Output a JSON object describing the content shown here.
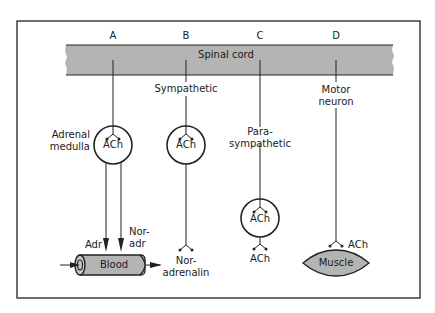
{
  "diagram": {
    "columns": [
      {
        "id": "A",
        "label": "A"
      },
      {
        "id": "B",
        "label": "B"
      },
      {
        "id": "C",
        "label": "C"
      },
      {
        "id": "D",
        "label": "D"
      }
    ],
    "spinal_cord": {
      "label": "Spinal cord",
      "color": "#b4b4b4"
    },
    "pathway_a": {
      "organ_label_line1": "Adrenal",
      "organ_label_line2": "medulla",
      "ganglion_label": "ACh",
      "output_left": "Adr",
      "output_right_line1": "Nor-",
      "output_right_line2": "adr",
      "target": "Blood"
    },
    "pathway_b": {
      "label": "Sympathetic",
      "ganglion_label": "ACh",
      "transmitter_line1": "Nor-",
      "transmitter_line2": "adrenalin"
    },
    "pathway_c": {
      "label_line1": "Para-",
      "label_line2": "sympathetic",
      "ganglion_label": "ACh",
      "transmitter": "ACh"
    },
    "pathway_d": {
      "label_line1": "Motor",
      "label_line2": "neuron",
      "transmitter": "ACh",
      "target": "Muscle"
    }
  }
}
